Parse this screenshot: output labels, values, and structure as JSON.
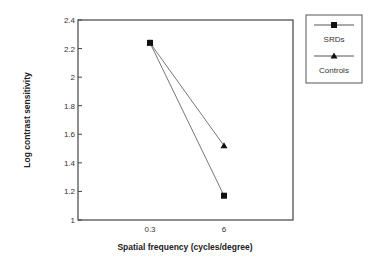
{
  "chart_data": {
    "type": "line",
    "title": "",
    "xlabel": "Spatial frequency (cycles/degree)",
    "ylabel": "Log contrast sensitivity",
    "categories": [
      "0.3",
      "6"
    ],
    "series": [
      {
        "name": "SRDs",
        "marker": "square",
        "values": [
          2.24,
          1.17
        ]
      },
      {
        "name": "Controls",
        "marker": "triangle",
        "values": [
          2.24,
          1.52
        ]
      }
    ],
    "ylim": [
      1,
      2.4
    ],
    "yticks": [
      "1",
      "1.2",
      "1.4",
      "1.6",
      "1.8",
      "2",
      "2.2",
      "2.4"
    ],
    "grid": false,
    "legend_position": "right-outside-top"
  },
  "colors": {
    "line": "#777777",
    "marker": "#111111",
    "axis": "#444444"
  }
}
